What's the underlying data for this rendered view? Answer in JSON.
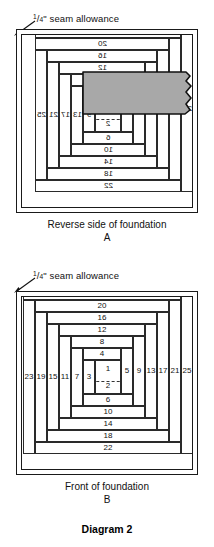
{
  "page": {
    "title": "Diagram 2",
    "background": "#ffffff",
    "ink": "#111111",
    "patch_color": "#a8a8a8"
  },
  "seam_allowance": {
    "numerator": "1",
    "denominator": "4",
    "quote": "\"",
    "text": " seam allowance"
  },
  "figures": [
    {
      "id": "A",
      "caption": "Reverse side of foundation",
      "letter": "A",
      "mirrored": true,
      "center": {
        "top": "1",
        "bottom": "2"
      },
      "strips_top": [
        "4",
        "8",
        "12",
        "16",
        "20",
        "24"
      ],
      "strips_bottom": [
        "6",
        "10",
        "14",
        "18",
        "22"
      ],
      "strips_left": [
        "9",
        "13",
        "17",
        "21",
        "25"
      ],
      "strips_right": [
        "3",
        "7",
        "11",
        "15",
        "19",
        "23"
      ],
      "patch": {
        "label": "23",
        "color": "#a8a8a8"
      }
    },
    {
      "id": "B",
      "caption": "Front of foundation",
      "letter": "B",
      "mirrored": false,
      "center": {
        "top": "1",
        "bottom": "2"
      },
      "strips_top": [
        "4",
        "8",
        "12",
        "16",
        "20",
        "24"
      ],
      "strips_bottom": [
        "6",
        "10",
        "14",
        "18",
        "22"
      ],
      "strips_left": [
        "3",
        "7",
        "11",
        "15",
        "19",
        "23"
      ],
      "strips_right": [
        "5",
        "9",
        "13",
        "17",
        "21",
        "25"
      ]
    }
  ]
}
